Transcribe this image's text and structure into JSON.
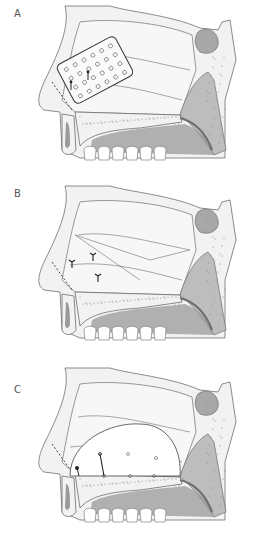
{
  "figure": {
    "panels": [
      {
        "label": "A",
        "top": 0,
        "variant": "perforated-plate"
      },
      {
        "label": "B",
        "top": 180,
        "variant": "sutures"
      },
      {
        "label": "C",
        "top": 362,
        "variant": "septal-flap"
      }
    ]
  },
  "colors": {
    "bone_fill": "#f2f2f2",
    "outline": "#6e6e6e",
    "cavity_fill": "#f7f7f7",
    "shadow_fill": "#bdbdbd",
    "dark_fill": "#9a9a9a",
    "sinus_fill": "#a8a8a8",
    "stitch": "#222222",
    "dash": "#333333"
  }
}
